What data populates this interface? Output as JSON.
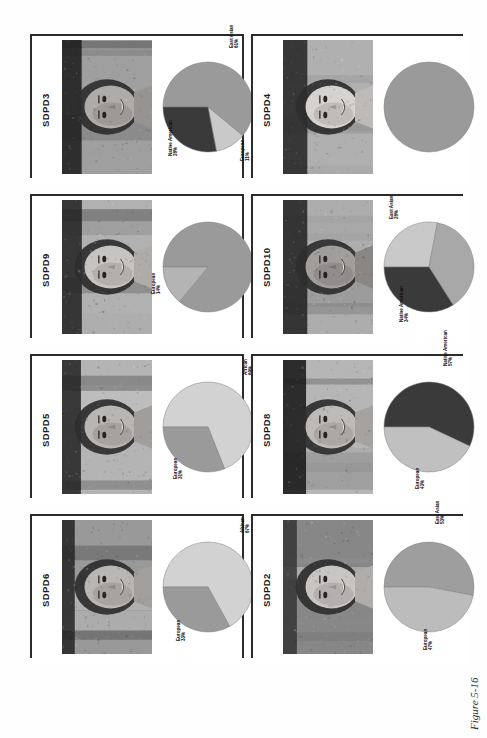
{
  "caption": "Figure 5-16",
  "colors": {
    "european": "#9a9a9a",
    "east_asian": "#c9c9c9",
    "native_american": "#3a3a3a",
    "african": "#d2d2d2",
    "rule": "#2b2b2b",
    "text": "#111111",
    "page_bg": "#ffffff"
  },
  "legend_keys": [
    "European",
    "East Asian",
    "Native American",
    "African"
  ],
  "panels": [
    {
      "id": "SDPD3",
      "col": 0,
      "row": 0,
      "chart_data": {
        "type": "pie",
        "title": "SDPD3",
        "categories": [
          "East Asian",
          "European",
          "Native American"
        ],
        "values": [
          61,
          11,
          28
        ],
        "labels": [
          "East Asian 61%",
          "European 11%",
          "Native American 28%"
        ],
        "colors": [
          "#9a9a9a",
          "#c9c9c9",
          "#3a3a3a"
        ],
        "legend": "slice callouts"
      }
    },
    {
      "id": "SDPD4",
      "col": 1,
      "row": 0,
      "chart_data": {
        "type": "pie",
        "title": "SDPD4",
        "categories": [
          "European"
        ],
        "values": [
          100
        ],
        "labels": [
          "European 100%"
        ],
        "colors": [
          "#9a9a9a"
        ],
        "legend": "slice callouts"
      }
    },
    {
      "id": "SDPD9",
      "col": 0,
      "row": 1,
      "chart_data": {
        "type": "pie",
        "title": "SDPD9",
        "categories": [
          "East Asian",
          "European"
        ],
        "values": [
          86,
          14
        ],
        "labels": [
          "East Asian 86%",
          "European 14%"
        ],
        "colors": [
          "#9a9a9a",
          "#b4b4b4"
        ],
        "legend": "slice callouts"
      }
    },
    {
      "id": "SDPD10",
      "col": 1,
      "row": 1,
      "chart_data": {
        "type": "pie",
        "title": "SDPD10",
        "categories": [
          "East Asian",
          "European",
          "Native American"
        ],
        "values": [
          28,
          38,
          34
        ],
        "labels": [
          "East Asian 28%",
          "European 38%",
          "Native American 34%"
        ],
        "colors": [
          "#c9c9c9",
          "#a8a8a8",
          "#3a3a3a"
        ],
        "legend": "slice callouts"
      }
    },
    {
      "id": "SDPD5",
      "col": 0,
      "row": 2,
      "chart_data": {
        "type": "pie",
        "title": "SDPD5",
        "categories": [
          "African",
          "European"
        ],
        "values": [
          69,
          31
        ],
        "labels": [
          "African 69%",
          "European 31%"
        ],
        "colors": [
          "#d2d2d2",
          "#9a9a9a"
        ],
        "legend": "slice callouts"
      }
    },
    {
      "id": "SDPD8",
      "col": 1,
      "row": 2,
      "chart_data": {
        "type": "pie",
        "title": "SDPD8",
        "categories": [
          "Native American",
          "European"
        ],
        "values": [
          57,
          43
        ],
        "labels": [
          "Native American 57%",
          "European 43%"
        ],
        "colors": [
          "#3a3a3a",
          "#c0c0c0"
        ],
        "legend": "slice callouts"
      }
    },
    {
      "id": "SDPD6",
      "col": 0,
      "row": 3,
      "chart_data": {
        "type": "pie",
        "title": "SDPD6",
        "categories": [
          "African",
          "European"
        ],
        "values": [
          67,
          33
        ],
        "labels": [
          "African 67%",
          "European 33%"
        ],
        "colors": [
          "#d2d2d2",
          "#9a9a9a"
        ],
        "legend": "slice callouts"
      }
    },
    {
      "id": "SDPD2",
      "col": 1,
      "row": 3,
      "chart_data": {
        "type": "pie",
        "title": "SDPD2",
        "categories": [
          "East Asian",
          "European"
        ],
        "values": [
          53,
          47
        ],
        "labels": [
          "East Asian 53%",
          "European 47%"
        ],
        "colors": [
          "#9e9e9e",
          "#bcbcbc"
        ],
        "legend": "slice callouts"
      }
    }
  ]
}
